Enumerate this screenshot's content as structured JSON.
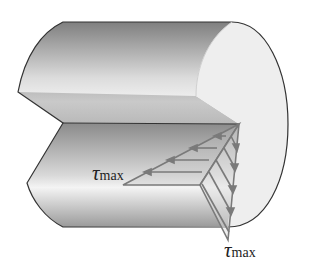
{
  "figure": {
    "labels": [
      {
        "id": "tau_horizontal",
        "symbol": "τ",
        "subscript": "max"
      },
      {
        "id": "tau_vertical",
        "symbol": "τ",
        "subscript": "max"
      }
    ],
    "colors": {
      "outline": "#333333",
      "end_face": "#eeeeee",
      "body_dark": "#8e8e8e",
      "body_light": "#e6e6e6",
      "stress_lines": "#7a7a7a",
      "background": "#ffffff"
    },
    "stress_arrows": {
      "horizontal_count": 4,
      "vertical_count": 5
    }
  }
}
